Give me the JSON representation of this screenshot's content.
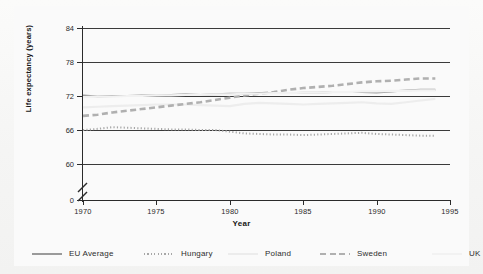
{
  "chart_data": {
    "type": "line",
    "title": "",
    "xlabel": "Year",
    "ylabel": "Life expectancy (years)",
    "xlim": [
      1970,
      1995
    ],
    "ylim": [
      60,
      84
    ],
    "y_axis_break": true,
    "y_break_label": "0",
    "grid": true,
    "grid_orientation": "horizontal",
    "legend_position": "bottom",
    "xticks": [
      "1970",
      "1975",
      "1980",
      "1985",
      "1990",
      "1995"
    ],
    "xtick_values": [
      1970,
      1975,
      1980,
      1985,
      1990,
      1995
    ],
    "yticks": [
      "0",
      "60",
      "66",
      "72",
      "78",
      "84"
    ],
    "ytick_values": [
      0,
      60,
      66,
      72,
      78,
      84
    ],
    "x": [
      1970,
      1971,
      1972,
      1973,
      1974,
      1975,
      1976,
      1977,
      1978,
      1979,
      1980,
      1981,
      1982,
      1983,
      1984,
      1985,
      1986,
      1987,
      1988,
      1989,
      1990,
      1991,
      1992,
      1993,
      1994
    ],
    "series": [
      {
        "name": "EU Average",
        "style": "solid",
        "color": "#9a9a9a",
        "values": [
          72.1,
          71.9,
          72.0,
          72.0,
          72.1,
          72.1,
          72.2,
          72.3,
          72.2,
          72.3,
          72.4,
          72.4,
          72.5,
          72.5,
          72.5,
          72.6,
          72.6,
          72.7,
          72.7,
          72.7,
          72.6,
          72.8,
          73.0,
          73.1,
          73.1
        ]
      },
      {
        "name": "Hungary",
        "style": "dotted",
        "color": "#a7a7a7",
        "values": [
          66.0,
          66.2,
          66.5,
          66.4,
          66.3,
          66.2,
          66.1,
          66.1,
          66.0,
          66.0,
          65.7,
          65.4,
          65.3,
          65.2,
          65.2,
          65.1,
          65.2,
          65.3,
          65.4,
          65.5,
          65.3,
          65.2,
          65.1,
          65.0,
          65.0
        ]
      },
      {
        "name": "Poland",
        "style": "solid-faint",
        "color": "#ededed",
        "values": [
          70.0,
          70.1,
          70.2,
          70.3,
          70.4,
          70.5,
          70.5,
          70.5,
          70.4,
          70.3,
          70.2,
          70.6,
          70.8,
          70.7,
          70.6,
          70.5,
          70.6,
          70.7,
          70.8,
          70.9,
          70.7,
          70.6,
          70.9,
          71.2,
          71.5
        ]
      },
      {
        "name": "Sweden",
        "style": "dashed",
        "color": "#b0b0b0",
        "values": [
          68.5,
          68.7,
          69.1,
          69.4,
          69.7,
          70.0,
          70.3,
          70.6,
          70.9,
          71.3,
          71.7,
          72.1,
          72.4,
          72.7,
          73.1,
          73.4,
          73.6,
          73.8,
          74.1,
          74.4,
          74.6,
          74.7,
          74.9,
          75.1,
          75.1
        ]
      },
      {
        "name": "UK",
        "style": "solid-faint",
        "color": "#f2f2f2",
        "values": [
          71.8,
          71.9,
          71.9,
          72.0,
          72.0,
          72.1,
          72.1,
          72.2,
          72.2,
          72.3,
          72.3,
          72.4,
          72.4,
          72.5,
          72.5,
          72.6,
          72.6,
          72.7,
          72.7,
          72.8,
          72.8,
          72.9,
          72.9,
          73.0,
          73.0
        ]
      }
    ]
  },
  "legend": {
    "items": [
      {
        "label": "EU Average",
        "style": "solid",
        "color": "#9a9a9a"
      },
      {
        "label": "Hungary",
        "style": "dotted",
        "color": "#a7a7a7"
      },
      {
        "label": "Poland",
        "style": "solid-faint",
        "color": "#ececec"
      },
      {
        "label": "Sweden",
        "style": "dashed",
        "color": "#b0b0b0"
      },
      {
        "label": "UK",
        "style": "solid-faint",
        "color": "#f2f2f2"
      }
    ]
  }
}
